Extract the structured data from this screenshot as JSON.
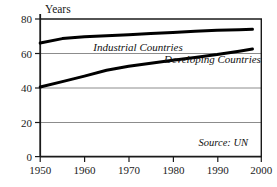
{
  "chart_data": {
    "type": "line",
    "title": "",
    "subtitle": "",
    "xlabel": "",
    "ylabel": "Years",
    "ylabel_position": "top-left-above-axis",
    "xlim": [
      1950,
      2000
    ],
    "ylim": [
      0,
      80
    ],
    "grid": "horizontal",
    "legend_position": "inline-on-plot",
    "x_ticks": [
      1950,
      1960,
      1970,
      1980,
      1990,
      2000
    ],
    "x_tick_labels": [
      "1950",
      "1960",
      "1970",
      "1980",
      "1990",
      "2000"
    ],
    "y_ticks": [
      0,
      20,
      40,
      60,
      80
    ],
    "y_tick_labels": [
      "0",
      "20",
      "40",
      "60",
      "80"
    ],
    "x": [
      1950,
      1955,
      1960,
      1965,
      1970,
      1975,
      1980,
      1985,
      1990,
      1995,
      1998
    ],
    "series": [
      {
        "name": "Industrial Countries",
        "label": "Industrial Countries",
        "color": "#000000",
        "values": [
          66.0,
          68.6,
          69.7,
          70.3,
          70.9,
          71.5,
          72.2,
          72.9,
          73.4,
          73.8,
          74.0
        ],
        "label_x": 1962,
        "label_y": 61.5
      },
      {
        "name": "Developing Countries",
        "label": "Developing Countries",
        "color": "#000000",
        "values": [
          40.5,
          43.6,
          46.8,
          50.2,
          52.5,
          54.3,
          56.0,
          57.6,
          59.3,
          61.3,
          62.5
        ],
        "label_x": 1978,
        "label_y": 54.5
      }
    ],
    "annotations": [
      {
        "text": "Source: UN",
        "x": 1997,
        "y": 6,
        "align": "right",
        "style": "italic"
      }
    ]
  },
  "axes": {
    "y_axis_title": "Years"
  },
  "colors": {
    "frame": "#1a1a1a",
    "gridline": "#8c8c8c",
    "series_line": "#000000",
    "background": "#ffffff",
    "text": "#1a1a1a"
  }
}
